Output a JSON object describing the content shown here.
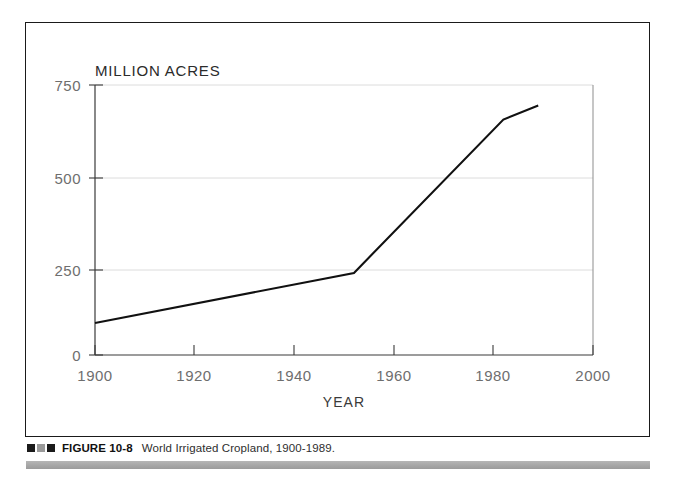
{
  "figure": {
    "unit_label": "MILLION ACRES",
    "caption_markers": [
      "dark",
      "gray",
      "dark"
    ],
    "caption_figure_number": "FIGURE 10-8",
    "caption_text": "World Irrigated Cropland, 1900-1989."
  },
  "colors": {
    "frame": "#1a1a1a",
    "axis": "#3a3a3a",
    "grid": "#d8d8d8",
    "data_line": "#111111",
    "tick_label": "#6e6e6e",
    "rule_gray": "#a9a9a9",
    "marker_dark": "#1b1b1b",
    "marker_gray": "#9a9a9a"
  },
  "chart_data": {
    "type": "line",
    "title": "",
    "xlabel": "YEAR",
    "ylabel": "MILLION ACRES",
    "xlim": [
      1900,
      2000
    ],
    "ylim": [
      0,
      750
    ],
    "xticks": [
      1900,
      1920,
      1940,
      1960,
      1980,
      2000
    ],
    "xtick_labels": [
      "1900",
      "1920",
      "1940",
      "1960",
      "1980",
      "2000"
    ],
    "yticks": [
      0,
      250,
      500,
      750
    ],
    "ytick_labels": [
      "0",
      "250",
      "500",
      "750"
    ],
    "grid": "horizontal",
    "legend": "none",
    "series": [
      {
        "name": "World Irrigated Cropland",
        "x": [
          1900,
          1952,
          1982,
          1989
        ],
        "values": [
          89,
          228,
          654,
          693
        ]
      }
    ]
  }
}
